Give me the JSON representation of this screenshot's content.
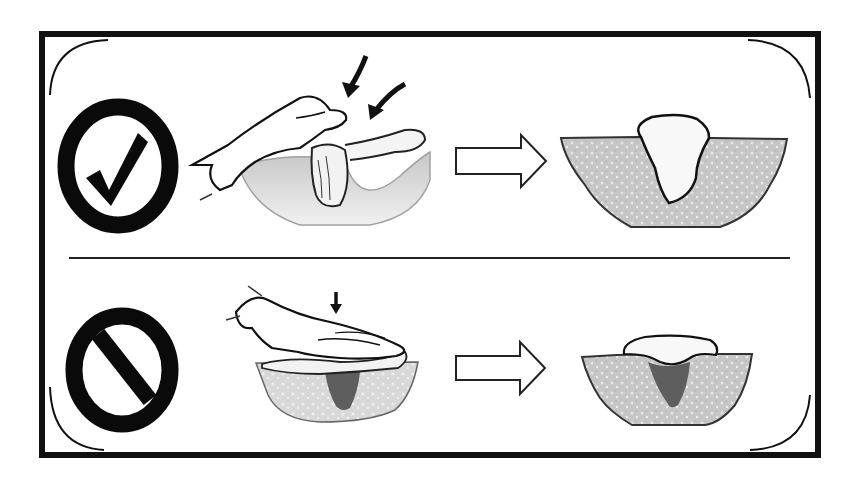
{
  "figure": {
    "kind": "instructional-comparison",
    "background": "#ffffff",
    "frame_color": "#111111",
    "tissue_fill": "#c4c4c4",
    "packing_fill": "#f8f8f8",
    "dead_space_fill": "#5e5e5e",
    "rows": [
      {
        "id": "correct",
        "verdict_icon": "check-circle-icon",
        "verdict_meaning": "Correct",
        "action": "Gloved hand inserts packing deep into the wound base, filling it loosely",
        "arrows_count": 2,
        "result": "Packing fills the wound down to the base; no dead space"
      },
      {
        "id": "incorrect",
        "verdict_icon": "prohibited-icon",
        "verdict_meaning": "Incorrect",
        "action": "Flat hand presses packing over the top of the wound",
        "arrows_count": 1,
        "result": "Packing bridges the surface; dead space remains below"
      }
    ],
    "transition_icon": "right-arrow-outline-icon"
  }
}
